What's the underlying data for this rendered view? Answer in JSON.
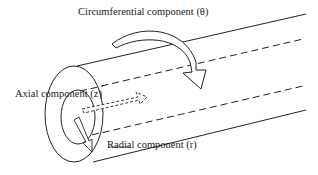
{
  "diagram": {
    "type": "pipe-flow-components",
    "labels": {
      "circumferential": "Circumferential component (θ)",
      "axial": "Axial component (z)",
      "radial": "Radial component (r)"
    },
    "colors": {
      "stroke": "#222222",
      "text": "#1a1a1a",
      "background": "#ffffff"
    }
  }
}
